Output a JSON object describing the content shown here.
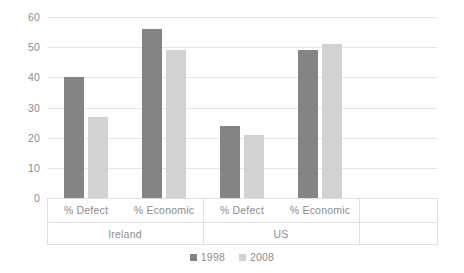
{
  "chart_data": {
    "type": "bar",
    "title": "",
    "subtitle": "",
    "xlabel": "",
    "ylabel": "",
    "ylim": [
      0,
      60
    ],
    "yticks": [
      0,
      10,
      20,
      30,
      40,
      50,
      60
    ],
    "ytick_labels": [
      "0",
      "10",
      "20",
      "30",
      "40",
      "50",
      "60"
    ],
    "grid": true,
    "grid_axis": "y",
    "legend_position": "bottom-center",
    "background_color": "#ffffff",
    "gridline_color": "#e6e6e6",
    "groups": [
      "Ireland",
      "US"
    ],
    "categories": [
      "% Defect",
      "% Economic",
      "% Defect",
      "% Economic"
    ],
    "group_spans": [
      2,
      2
    ],
    "series": [
      {
        "name": "1998",
        "color": "#848484",
        "values": [
          40,
          56,
          24,
          49
        ]
      },
      {
        "name": "2008",
        "color": "#d2d2d2",
        "values": [
          27,
          49,
          21,
          51
        ]
      }
    ],
    "points": [
      {
        "group": "Ireland",
        "category": "% Defect",
        "series": "1998",
        "value": 40
      },
      {
        "group": "Ireland",
        "category": "% Defect",
        "series": "2008",
        "value": 27
      },
      {
        "group": "Ireland",
        "category": "% Economic",
        "series": "1998",
        "value": 56
      },
      {
        "group": "Ireland",
        "category": "% Economic",
        "series": "2008",
        "value": 49
      },
      {
        "group": "US",
        "category": "% Defect",
        "series": "1998",
        "value": 24
      },
      {
        "group": "US",
        "category": "% Defect",
        "series": "2008",
        "value": 21
      },
      {
        "group": "US",
        "category": "% Economic",
        "series": "1998",
        "value": 49
      },
      {
        "group": "US",
        "category": "% Economic",
        "series": "2008",
        "value": 51
      }
    ]
  },
  "legend": {
    "items": [
      {
        "label": "1998",
        "color": "#848484"
      },
      {
        "label": "2008",
        "color": "#d2d2d2"
      }
    ]
  },
  "axis": {
    "y_labels": [
      "60",
      "50",
      "40",
      "30",
      "20",
      "10",
      "0"
    ],
    "category_labels": [
      "% Defect",
      "% Economic",
      "% Defect",
      "% Economic"
    ],
    "group_labels": [
      "Ireland",
      "US"
    ]
  }
}
